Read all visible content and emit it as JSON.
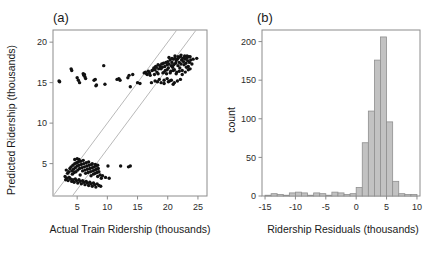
{
  "figure": {
    "background": "#ffffff",
    "point_color": "#111111",
    "bar_fill": "#c2c2c2",
    "bar_stroke": "#8f8f8f",
    "refline_color": "#b9b9b9",
    "axis_color": "#8c8c8c"
  },
  "panel_a": {
    "label": "(a)",
    "xlabel": "Actual Train Ridership (thousands)",
    "ylabel": "Predicted Ridership (thousands)",
    "xticks": [
      5,
      10,
      15,
      20,
      25
    ],
    "yticks": [
      5,
      10,
      15,
      20
    ],
    "xtick_labels": [
      "5",
      "10",
      "15",
      "20",
      "25"
    ],
    "ytick_labels": [
      "5",
      "10",
      "15",
      "20"
    ],
    "xlim": [
      1.0,
      26.5
    ],
    "ylim": [
      1.0,
      21.5
    ]
  },
  "panel_b": {
    "label": "(b)",
    "xlabel": "Ridership Residuals (thousands)",
    "ylabel": "count",
    "xticks": [
      -15,
      -10,
      -5,
      0,
      5,
      10
    ],
    "yticks": [
      0,
      50,
      100,
      150,
      200
    ],
    "xtick_labels": [
      "-15",
      "-10",
      "-5",
      "0",
      "5",
      "10"
    ],
    "ytick_labels": [
      "0",
      "50",
      "100",
      "150",
      "200"
    ],
    "xlim": [
      -15.5,
      10.5
    ],
    "ylim": [
      0,
      215
    ]
  },
  "chart_data": [
    {
      "type": "scatter",
      "panel": "(a)",
      "title": "",
      "xlabel": "Actual Train Ridership (thousands)",
      "ylabel": "Predicted Ridership (thousands)",
      "xlim": [
        1.0,
        26.5
      ],
      "ylim": [
        1.0,
        21.5
      ],
      "xticks": [
        5,
        10,
        15,
        20,
        25
      ],
      "yticks": [
        5,
        10,
        15,
        20
      ],
      "grid": false,
      "legend": "none",
      "annotations": [
        {
          "kind": "line",
          "name": "identity-line",
          "x0": 1.0,
          "y0": 1.0,
          "x1": 21.5,
          "y1": 21.5,
          "color": "#b9b9b9"
        },
        {
          "kind": "line",
          "name": "offset-line",
          "x0": 4.2,
          "y0": 1.0,
          "x1": 24.7,
          "y1": 21.5,
          "color": "#b9b9b9"
        }
      ],
      "series": [
        {
          "name": "predicted vs actual",
          "marker": "filled-circle",
          "color": "#111111",
          "points": [
            [
              2.0,
              15.2
            ],
            [
              2.1,
              15.1
            ],
            [
              4.0,
              16.7
            ],
            [
              4.1,
              16.5
            ],
            [
              5.0,
              15.6
            ],
            [
              5.2,
              15.3
            ],
            [
              5.4,
              15.0
            ],
            [
              6.0,
              16.1
            ],
            [
              6.1,
              15.9
            ],
            [
              6.2,
              16.0
            ],
            [
              6.3,
              15.7
            ],
            [
              6.4,
              15.5
            ],
            [
              7.8,
              15.3
            ],
            [
              8.0,
              15.4
            ],
            [
              8.1,
              14.6
            ],
            [
              8.2,
              14.7
            ],
            [
              9.4,
              17.1
            ],
            [
              9.6,
              14.8
            ],
            [
              11.6,
              15.4
            ],
            [
              11.9,
              15.5
            ],
            [
              12.1,
              15.3
            ],
            [
              13.4,
              15.6
            ],
            [
              13.6,
              15.9
            ],
            [
              13.8,
              14.5
            ],
            [
              14.2,
              16.0
            ],
            [
              15.0,
              15.0
            ],
            [
              15.4,
              14.9
            ],
            [
              16.1,
              16.2
            ],
            [
              16.3,
              16.3
            ],
            [
              16.5,
              16.1
            ],
            [
              16.6,
              16.0
            ],
            [
              16.8,
              16.4
            ],
            [
              17.0,
              16.2
            ],
            [
              17.1,
              15.9
            ],
            [
              17.3,
              15.0
            ],
            [
              17.4,
              16.5
            ],
            [
              17.6,
              16.6
            ],
            [
              17.7,
              16.8
            ],
            [
              17.8,
              16.0
            ],
            [
              17.9,
              15.2
            ],
            [
              18.0,
              17.0
            ],
            [
              18.1,
              16.9
            ],
            [
              18.2,
              16.3
            ],
            [
              18.3,
              15.1
            ],
            [
              18.4,
              17.2
            ],
            [
              18.5,
              16.7
            ],
            [
              18.6,
              15.4
            ],
            [
              18.7,
              17.1
            ],
            [
              18.8,
              16.8
            ],
            [
              18.9,
              15.0
            ],
            [
              19.0,
              17.3
            ],
            [
              19.1,
              16.9
            ],
            [
              19.2,
              16.2
            ],
            [
              19.3,
              17.4
            ],
            [
              19.4,
              15.3
            ],
            [
              19.5,
              17.0
            ],
            [
              19.6,
              16.5
            ],
            [
              19.7,
              17.5
            ],
            [
              19.8,
              16.1
            ],
            [
              19.9,
              17.2
            ],
            [
              20.0,
              17.6
            ],
            [
              20.1,
              16.8
            ],
            [
              20.2,
              17.3
            ],
            [
              20.3,
              15.2
            ],
            [
              20.4,
              17.8
            ],
            [
              20.5,
              16.4
            ],
            [
              20.6,
              17.1
            ],
            [
              20.7,
              17.5
            ],
            [
              20.8,
              16.9
            ],
            [
              20.9,
              17.9
            ],
            [
              21.0,
              17.2
            ],
            [
              21.1,
              16.6
            ],
            [
              21.2,
              18.0
            ],
            [
              21.3,
              17.4
            ],
            [
              21.4,
              17.7
            ],
            [
              21.5,
              16.3
            ],
            [
              21.6,
              17.9
            ],
            [
              21.7,
              17.1
            ],
            [
              21.8,
              18.1
            ],
            [
              21.9,
              17.5
            ],
            [
              22.0,
              16.8
            ],
            [
              22.1,
              18.2
            ],
            [
              22.2,
              17.3
            ],
            [
              22.3,
              17.8
            ],
            [
              22.4,
              16.5
            ],
            [
              22.5,
              18.0
            ],
            [
              22.6,
              17.6
            ],
            [
              22.7,
              17.2
            ],
            [
              22.8,
              18.3
            ],
            [
              22.9,
              17.9
            ],
            [
              23.0,
              17.4
            ],
            [
              23.1,
              16.9
            ],
            [
              23.2,
              18.1
            ],
            [
              23.3,
              17.7
            ],
            [
              23.4,
              17.0
            ],
            [
              23.5,
              18.2
            ],
            [
              23.6,
              17.5
            ],
            [
              23.7,
              16.7
            ],
            [
              23.8,
              17.8
            ],
            [
              24.0,
              17.3
            ],
            [
              24.2,
              17.9
            ],
            [
              24.8,
              18.0
            ],
            [
              20.1,
              15.1
            ],
            [
              20.6,
              15.3
            ],
            [
              21.1,
              15.0
            ],
            [
              21.6,
              15.2
            ],
            [
              22.1,
              15.4
            ],
            [
              19.4,
              14.9
            ],
            [
              19.9,
              15.5
            ],
            [
              20.9,
              14.8
            ],
            [
              17.9,
              16.6
            ],
            [
              18.4,
              16.1
            ],
            [
              18.9,
              16.7
            ],
            [
              19.4,
              16.3
            ],
            [
              19.9,
              16.6
            ],
            [
              20.4,
              16.2
            ],
            [
              20.9,
              16.5
            ],
            [
              21.4,
              16.1
            ],
            [
              21.9,
              16.4
            ],
            [
              22.4,
              16.0
            ],
            [
              22.9,
              16.3
            ],
            [
              23.4,
              16.6
            ],
            [
              20.2,
              18.1
            ],
            [
              20.7,
              18.0
            ],
            [
              21.2,
              18.3
            ],
            [
              21.7,
              18.2
            ],
            [
              22.2,
              18.4
            ],
            [
              22.7,
              18.1
            ],
            [
              23.2,
              18.3
            ],
            [
              23.7,
              18.2
            ],
            [
              3.2,
              4.2
            ],
            [
              3.4,
              3.8
            ],
            [
              3.6,
              4.0
            ],
            [
              3.8,
              4.4
            ],
            [
              4.0,
              4.6
            ],
            [
              4.1,
              4.1
            ],
            [
              4.2,
              3.7
            ],
            [
              4.3,
              4.8
            ],
            [
              4.4,
              4.3
            ],
            [
              4.5,
              3.9
            ],
            [
              4.6,
              5.0
            ],
            [
              4.7,
              4.5
            ],
            [
              4.8,
              4.0
            ],
            [
              4.9,
              5.1
            ],
            [
              5.0,
              4.7
            ],
            [
              5.1,
              4.2
            ],
            [
              5.2,
              5.2
            ],
            [
              5.3,
              4.8
            ],
            [
              5.4,
              4.4
            ],
            [
              5.5,
              3.6
            ],
            [
              5.6,
              5.3
            ],
            [
              5.7,
              4.9
            ],
            [
              5.8,
              4.5
            ],
            [
              5.9,
              4.1
            ],
            [
              6.0,
              5.4
            ],
            [
              6.1,
              5.0
            ],
            [
              6.2,
              4.6
            ],
            [
              6.3,
              4.2
            ],
            [
              6.4,
              3.8
            ],
            [
              6.5,
              5.1
            ],
            [
              6.6,
              4.7
            ],
            [
              6.7,
              4.3
            ],
            [
              6.8,
              3.9
            ],
            [
              6.9,
              5.2
            ],
            [
              7.0,
              4.8
            ],
            [
              7.1,
              4.4
            ],
            [
              7.2,
              4.0
            ],
            [
              7.3,
              3.5
            ],
            [
              7.4,
              4.9
            ],
            [
              7.5,
              4.5
            ],
            [
              7.6,
              4.1
            ],
            [
              7.7,
              3.7
            ],
            [
              7.8,
              4.6
            ],
            [
              7.9,
              4.2
            ],
            [
              8.0,
              3.8
            ],
            [
              8.1,
              4.7
            ],
            [
              8.2,
              4.3
            ],
            [
              8.3,
              3.9
            ],
            [
              8.4,
              3.4
            ],
            [
              8.5,
              4.4
            ],
            [
              8.6,
              4.0
            ],
            [
              8.8,
              3.6
            ],
            [
              9.0,
              3.2
            ],
            [
              9.2,
              3.5
            ],
            [
              3.0,
              3.4
            ],
            [
              3.1,
              3.0
            ],
            [
              3.3,
              3.2
            ],
            [
              3.5,
              2.9
            ],
            [
              3.7,
              3.3
            ],
            [
              3.9,
              3.1
            ],
            [
              4.1,
              2.8
            ],
            [
              4.3,
              3.0
            ],
            [
              4.5,
              2.7
            ],
            [
              4.7,
              3.1
            ],
            [
              4.9,
              2.9
            ],
            [
              5.1,
              2.6
            ],
            [
              5.3,
              3.0
            ],
            [
              5.5,
              2.8
            ],
            [
              5.7,
              2.5
            ],
            [
              5.9,
              2.9
            ],
            [
              6.1,
              2.7
            ],
            [
              6.3,
              2.4
            ],
            [
              6.5,
              2.8
            ],
            [
              6.7,
              2.6
            ],
            [
              6.9,
              2.3
            ],
            [
              7.1,
              2.7
            ],
            [
              7.3,
              2.5
            ],
            [
              7.5,
              2.2
            ],
            [
              7.7,
              2.6
            ],
            [
              7.9,
              2.4
            ],
            [
              8.1,
              2.1
            ],
            [
              8.3,
              2.5
            ],
            [
              8.6,
              2.3
            ],
            [
              8.9,
              2.2
            ],
            [
              5.0,
              5.6
            ],
            [
              5.3,
              5.5
            ],
            [
              4.6,
              5.5
            ],
            [
              7.5,
              5.0
            ],
            [
              8.0,
              4.9
            ],
            [
              8.4,
              4.8
            ],
            [
              10.1,
              4.7
            ],
            [
              12.2,
              4.7
            ],
            [
              13.5,
              4.6
            ],
            [
              13.8,
              4.7
            ],
            [
              9.7,
              3.3
            ],
            [
              10.3,
              3.2
            ]
          ]
        }
      ]
    },
    {
      "type": "bar",
      "subtype": "histogram",
      "panel": "(b)",
      "title": "",
      "xlabel": "Ridership Residuals (thousands)",
      "ylabel": "count",
      "xlim": [
        -15.5,
        10.5
      ],
      "ylim": [
        0,
        215
      ],
      "xticks": [
        -15,
        -10,
        -5,
        0,
        5,
        10
      ],
      "yticks": [
        0,
        50,
        100,
        150,
        200
      ],
      "grid": false,
      "legend": "none",
      "bin_width": 1.0,
      "bin_starts": [
        -15,
        -14,
        -13,
        -12,
        -11,
        -10,
        -9,
        -8,
        -7,
        -6,
        -5,
        -4,
        -3,
        -2,
        -1,
        0,
        1,
        2,
        3,
        4,
        5,
        6,
        7,
        8,
        9
      ],
      "bin_centers": [
        -14.5,
        -13.5,
        -12.5,
        -11.5,
        -10.5,
        -9.5,
        -8.5,
        -7.5,
        -6.5,
        -5.5,
        -4.5,
        -3.5,
        -2.5,
        -1.5,
        -0.5,
        0.5,
        1.5,
        2.5,
        3.5,
        4.5,
        5.5,
        6.5,
        7.5,
        8.5,
        9.5
      ],
      "values": [
        1,
        3,
        2,
        1,
        4,
        5,
        4,
        1,
        4,
        3,
        1,
        5,
        4,
        2,
        3,
        11,
        69,
        110,
        176,
        206,
        96,
        19,
        3,
        2,
        2
      ]
    }
  ]
}
